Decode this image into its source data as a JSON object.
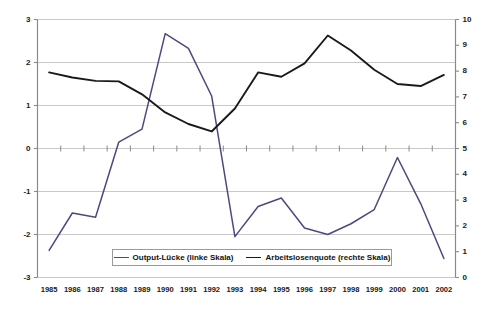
{
  "chart_data": {
    "type": "line",
    "title": "",
    "xlabel": "",
    "grid": true,
    "legend_position": "bottom-inside",
    "categories": [
      "1985",
      "1986",
      "1987",
      "1988",
      "1989",
      "1990",
      "1991",
      "1992",
      "1993",
      "1994",
      "1995",
      "1996",
      "1997",
      "1998",
      "1999",
      "2000",
      "2001",
      "2002"
    ],
    "axes": {
      "left": {
        "label": "",
        "ylim": [
          -3,
          3
        ],
        "ticks": [
          "3",
          "2",
          "1",
          "0",
          "-1",
          "-2",
          "-3"
        ],
        "tick_values": [
          3,
          2,
          1,
          0,
          -1,
          -2,
          -3
        ]
      },
      "right": {
        "label": "",
        "ylim": [
          0,
          10
        ],
        "ticks": [
          "10",
          "9",
          "8",
          "7",
          "6",
          "5",
          "4",
          "3",
          "2",
          "1",
          "0"
        ],
        "tick_values": [
          10,
          9,
          8,
          7,
          6,
          5,
          4,
          3,
          2,
          1,
          0
        ]
      }
    },
    "series": [
      {
        "name": "Output-Lücke (linke Skala)",
        "axis": "left",
        "color": "#4a4a80",
        "values": [
          -2.37,
          -1.5,
          -1.6,
          0.15,
          0.45,
          2.67,
          2.33,
          1.22,
          -2.05,
          -1.35,
          -1.15,
          -1.85,
          -2.0,
          -1.75,
          -1.42,
          -0.21,
          -1.28,
          -2.56
        ]
      },
      {
        "name": "Arbeitslosenquote (rechte Skala)",
        "axis": "right",
        "color": "#1a1a1a",
        "values": [
          7.95,
          7.75,
          7.62,
          7.6,
          7.1,
          6.4,
          5.95,
          5.66,
          6.55,
          7.95,
          7.78,
          8.3,
          9.38,
          8.8,
          8.05,
          7.5,
          7.42,
          7.85
        ]
      }
    ],
    "legend": [
      {
        "label": "Output-Lücke (linke Skala)",
        "color": "#4a4a80"
      },
      {
        "label": "Arbeitslosenquote (rechte Skala)",
        "color": "#1a1a1a"
      }
    ]
  },
  "colors": {
    "gridline": "#c8c8c8",
    "axis": "#8a8a8a",
    "series_output_gap": "#4a4a80",
    "series_unemployment": "#1a1a1a",
    "background": "#ffffff"
  }
}
